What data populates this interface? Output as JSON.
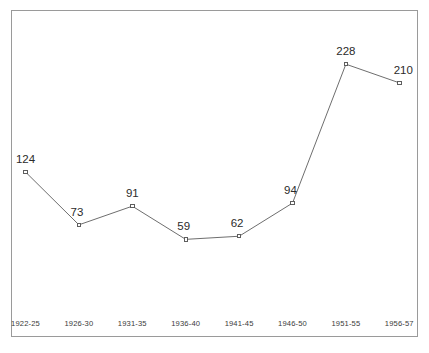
{
  "chart_data": {
    "type": "line",
    "title": "",
    "subtitle": "",
    "xlabel": "",
    "ylabel": "",
    "categories": [
      "1922-25",
      "1926-30",
      "1931-35",
      "1936-40",
      "1941-45",
      "1946-50",
      "1951-55",
      "1956-57"
    ],
    "values": [
      124,
      73,
      91,
      59,
      62,
      94,
      228,
      210
    ],
    "point_labels": [
      "124",
      "73",
      "91",
      "59",
      "62",
      "94",
      "228",
      "210"
    ],
    "series": [
      {
        "name": "",
        "values": [
          124,
          73,
          91,
          59,
          62,
          94,
          228,
          210
        ]
      }
    ],
    "ylim": [
      0,
      290
    ],
    "xlim": [
      0,
      7
    ],
    "grid": false,
    "legend": false,
    "legend_position": "none",
    "axis_visible": {
      "left_frame": true,
      "top_frame": true,
      "right_frame": true,
      "bottom_frame": true,
      "tick_marks": false,
      "y_tick_labels": false
    },
    "marker": "open-square",
    "annotations": []
  },
  "colors": {
    "background": "#ffffff",
    "frame": "#9a9a9a",
    "line": "#6e6e6e",
    "marker_stroke": "#4d4d4d",
    "marker_fill": "#ffffff",
    "value_label_text": "#2b2b2b",
    "tick_label_text": "#3a3a3a"
  }
}
